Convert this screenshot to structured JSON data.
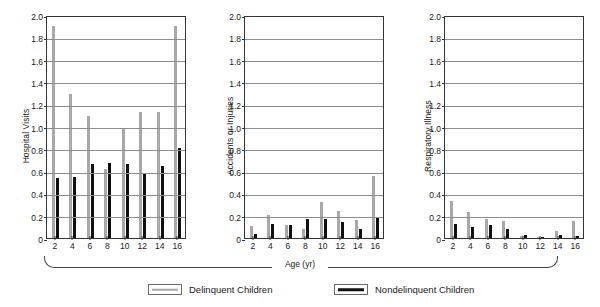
{
  "figure": {
    "xlabel": "Age (yr)",
    "legend": [
      {
        "label": "Delinquent Children",
        "color": "#a8a8a8",
        "key": "delinquent"
      },
      {
        "label": "Nondelinquent Children",
        "color": "#101010",
        "key": "nondelinquent"
      }
    ]
  },
  "chart_data": [
    {
      "type": "bar",
      "title": "",
      "ylabel": "Hospital Visits",
      "xlabel": "Age (yr)",
      "categories": [
        "2",
        "4",
        "6",
        "8",
        "10",
        "12",
        "14",
        "16"
      ],
      "ylim": [
        0,
        2.0
      ],
      "yticks": [
        "0",
        "0.2",
        "0.4",
        "0.6",
        "0.8",
        "1.0",
        "1.2",
        "1.4",
        "1.6",
        "1.8",
        "2.0"
      ],
      "grid": true,
      "legend_position": "below-figure",
      "series": [
        {
          "name": "Delinquent Children",
          "color": "#a8a8a8",
          "values": [
            1.9,
            1.29,
            1.09,
            0.62,
            0.99,
            1.13,
            1.13,
            1.9
          ]
        },
        {
          "name": "Nondelinquent Children",
          "color": "#101010",
          "values": [
            0.54,
            0.55,
            0.66,
            0.67,
            0.66,
            0.58,
            0.65,
            0.81
          ]
        }
      ]
    },
    {
      "type": "bar",
      "title": "",
      "ylabel": "Accidents or Injuries",
      "xlabel": "Age (yr)",
      "categories": [
        "2",
        "4",
        "6",
        "8",
        "10",
        "12",
        "14",
        "16"
      ],
      "ylim": [
        0,
        2.0
      ],
      "yticks": [
        "0",
        "0.2",
        "0.4",
        "0.6",
        "0.8",
        "1.0",
        "1.2",
        "1.4",
        "1.6",
        "1.8",
        "2.0"
      ],
      "grid": true,
      "legend_position": "below-figure",
      "series": [
        {
          "name": "Delinquent Children",
          "color": "#a8a8a8",
          "values": [
            0.11,
            0.21,
            0.12,
            0.08,
            0.32,
            0.24,
            0.16,
            0.56
          ]
        },
        {
          "name": "Nondelinquent Children",
          "color": "#101010",
          "values": [
            0.04,
            0.13,
            0.12,
            0.17,
            0.17,
            0.14,
            0.08,
            0.18
          ]
        }
      ]
    },
    {
      "type": "bar",
      "title": "",
      "ylabel": "Respiratory Illness",
      "xlabel": "Age (yr)",
      "categories": [
        "2",
        "4",
        "6",
        "8",
        "10",
        "12",
        "14",
        "16"
      ],
      "ylim": [
        0,
        2.0
      ],
      "yticks": [
        "0",
        "0.2",
        "0.4",
        "0.6",
        "0.8",
        "1.0",
        "1.2",
        "1.4",
        "1.6",
        "1.8",
        "2.0"
      ],
      "grid": true,
      "legend_position": "below-figure",
      "series": [
        {
          "name": "Delinquent Children",
          "color": "#a8a8a8",
          "values": [
            0.33,
            0.23,
            0.17,
            0.15,
            0.02,
            0.01,
            0.06,
            0.15
          ]
        },
        {
          "name": "Nondelinquent Children",
          "color": "#101010",
          "values": [
            0.13,
            0.1,
            0.12,
            0.08,
            0.03,
            0.01,
            0.03,
            0.02
          ]
        }
      ]
    }
  ]
}
